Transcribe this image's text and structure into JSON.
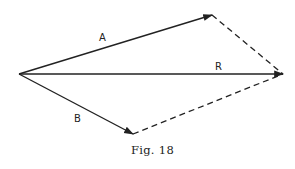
{
  "figure": {
    "caption": "Fig. 18",
    "colors": {
      "ink": "#222222",
      "background": "#ffffff"
    },
    "vectors": [
      {
        "id": "A",
        "label": "A",
        "style": "solid",
        "from": [
          19,
          74
        ],
        "to": [
          212,
          15
        ],
        "label_pos": [
          103,
          40
        ]
      },
      {
        "id": "R",
        "label": "R",
        "style": "solid",
        "from": [
          19,
          74
        ],
        "to": [
          283,
          74
        ],
        "label_pos": [
          219,
          70
        ]
      },
      {
        "id": "B",
        "label": "B",
        "style": "solid",
        "from": [
          19,
          74
        ],
        "to": [
          133,
          134
        ],
        "label_pos": [
          78,
          122
        ]
      }
    ],
    "construction_lines": [
      {
        "id": "A-to-R",
        "style": "dashed",
        "from": [
          212,
          15
        ],
        "to": [
          283,
          74
        ]
      },
      {
        "id": "B-to-R",
        "style": "dashed",
        "from": [
          133,
          134
        ],
        "to": [
          283,
          74
        ]
      }
    ]
  }
}
